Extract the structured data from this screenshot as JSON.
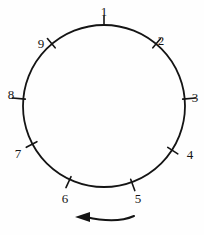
{
  "figure": {
    "kind": "circle-tick-diagram",
    "background_color": "#fefefe",
    "stroke_color": "#141414",
    "circle": {
      "cx": 104,
      "cy": 106,
      "r": 81,
      "stroke_width": 1.8
    },
    "rotation_indicator": {
      "name": "counterclockwise-arrow",
      "direction": "left",
      "path": "M 134 216 Q 116 224 86 217",
      "arrowhead": "M 90 212 L 75 217 L 90 222 Z"
    },
    "ticks": [
      {
        "label": "1",
        "angle_deg": 0,
        "tick_inner": 81,
        "tick_outer": 90,
        "label_x": 104,
        "label_y": 16,
        "anchor": "middle"
      },
      {
        "label": "2",
        "angle_deg": 40,
        "tick_inner": 76,
        "tick_outer": 88,
        "label_x": 161,
        "label_y": 45,
        "anchor": "middle"
      },
      {
        "label": "3",
        "angle_deg": 85,
        "tick_inner": 79,
        "tick_outer": 92,
        "label_x": 195,
        "label_y": 102,
        "anchor": "middle"
      },
      {
        "label": "4",
        "angle_deg": 123,
        "tick_inner": 76,
        "tick_outer": 88,
        "label_x": 190,
        "label_y": 159,
        "anchor": "middle"
      },
      {
        "label": "5",
        "angle_deg": 160,
        "tick_inner": 78,
        "tick_outer": 90,
        "label_x": 138,
        "label_y": 203,
        "anchor": "middle"
      },
      {
        "label": "6",
        "angle_deg": 205,
        "tick_inner": 78,
        "tick_outer": 90,
        "label_x": 65,
        "label_y": 203,
        "anchor": "middle"
      },
      {
        "label": "7",
        "angle_deg": 242,
        "tick_inner": 76,
        "tick_outer": 88,
        "label_x": 18,
        "label_y": 158,
        "anchor": "middle"
      },
      {
        "label": "8",
        "angle_deg": 275,
        "tick_inner": 79,
        "tick_outer": 92,
        "label_x": 11,
        "label_y": 99,
        "anchor": "middle"
      },
      {
        "label": "9",
        "angle_deg": 320,
        "tick_inner": 76,
        "tick_outer": 88,
        "label_x": 41,
        "label_y": 48,
        "anchor": "middle"
      }
    ]
  },
  "chart_data": {
    "type": "diagram",
    "title": "",
    "categories": [
      "1",
      "2",
      "3",
      "4",
      "5",
      "6",
      "7",
      "8",
      "9"
    ],
    "values": [
      0,
      40,
      85,
      123,
      160,
      205,
      242,
      275,
      320
    ],
    "value_unit": "degrees clockwise from top",
    "ordering": "counterclockwise",
    "legend": [],
    "annotations": [
      "counterclockwise direction arrow"
    ]
  }
}
